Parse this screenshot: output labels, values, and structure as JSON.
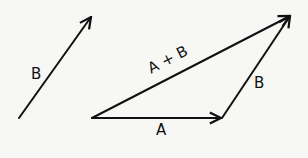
{
  "diagram": {
    "title": "",
    "vectors": [
      {
        "id": "B_free",
        "label": "B",
        "from": [
          19,
          118
        ],
        "to": [
          92,
          16
        ]
      },
      {
        "id": "A",
        "label": "A",
        "from": [
          92,
          118
        ],
        "to": [
          222,
          118
        ]
      },
      {
        "id": "B",
        "label": "B",
        "from": [
          222,
          118
        ],
        "to": [
          291,
          15
        ]
      },
      {
        "id": "A_plus_B",
        "label": "A + B",
        "from": [
          92,
          118
        ],
        "to": [
          291,
          15
        ]
      }
    ],
    "labels": {
      "b_free": "B",
      "a": "A",
      "b": "B",
      "sum": "A + B"
    },
    "colors": {
      "stroke": "#111111",
      "background": "#f7f7f5"
    }
  }
}
